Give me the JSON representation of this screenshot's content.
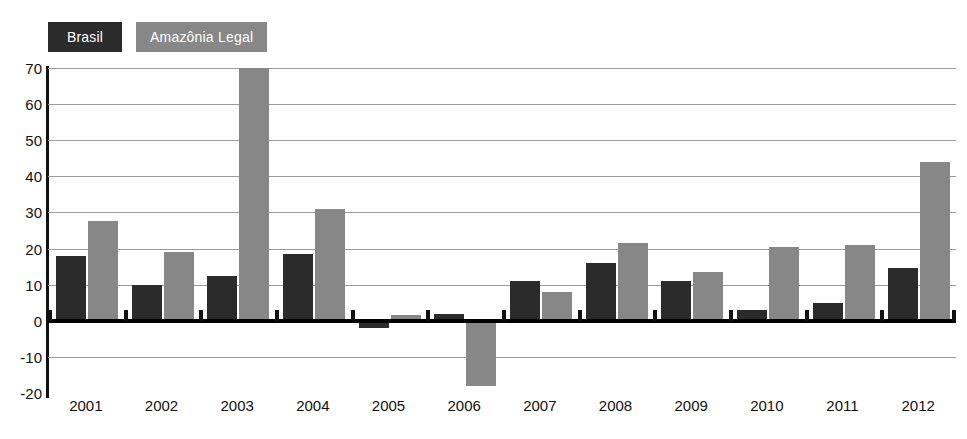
{
  "legend": {
    "items": [
      {
        "label": "Brasil",
        "color": "#2b2b2b",
        "key": "brasil"
      },
      {
        "label": "Amazônia Legal",
        "color": "#878787",
        "key": "amazonia"
      }
    ]
  },
  "axes": {
    "y_ticks": [
      "70",
      "60",
      "50",
      "40",
      "30",
      "20",
      "10",
      "0",
      "-10",
      "-20"
    ],
    "y_tick_values": [
      70,
      60,
      50,
      40,
      30,
      20,
      10,
      0,
      -10,
      -20
    ]
  },
  "chart_data": {
    "type": "bar",
    "title": "",
    "subtitle": "",
    "xlabel": "",
    "ylabel": "",
    "ylim": [
      -20,
      70
    ],
    "ytick_step": 10,
    "grid": true,
    "legend_position": "top-left",
    "clipped_note": "2003 Amazônia Legal bar extends above the top of the plot area (value exceeds 70)",
    "categories": [
      "2001",
      "2002",
      "2003",
      "2004",
      "2005",
      "2006",
      "2007",
      "2008",
      "2009",
      "2010",
      "2011",
      "2012"
    ],
    "series": [
      {
        "name": "Brasil",
        "color": "#2b2b2b",
        "values": [
          18,
          10,
          12.5,
          18.5,
          -2,
          2,
          11,
          16,
          11,
          3,
          5,
          14.5
        ]
      },
      {
        "name": "Amazônia Legal",
        "color": "#878787",
        "values": [
          27.5,
          19,
          74,
          31,
          1.5,
          -18,
          8,
          21.5,
          13.5,
          20.5,
          21,
          44
        ]
      }
    ]
  }
}
